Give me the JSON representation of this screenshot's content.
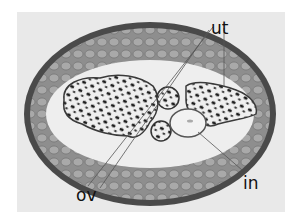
{
  "figure": {
    "labels": {
      "uterus": "ut",
      "ovary": "ov",
      "intestine": "in"
    },
    "colors": {
      "page_background": "#ffffff",
      "photo_background": "#e9e9e9",
      "cuticle": "#4a4a4a",
      "muscle": "#8a8a8a",
      "body_cavity": "#eeeeee",
      "egg_dark": "#1c1c1c",
      "label_text": "#111111",
      "leader_line": "#555555"
    }
  }
}
